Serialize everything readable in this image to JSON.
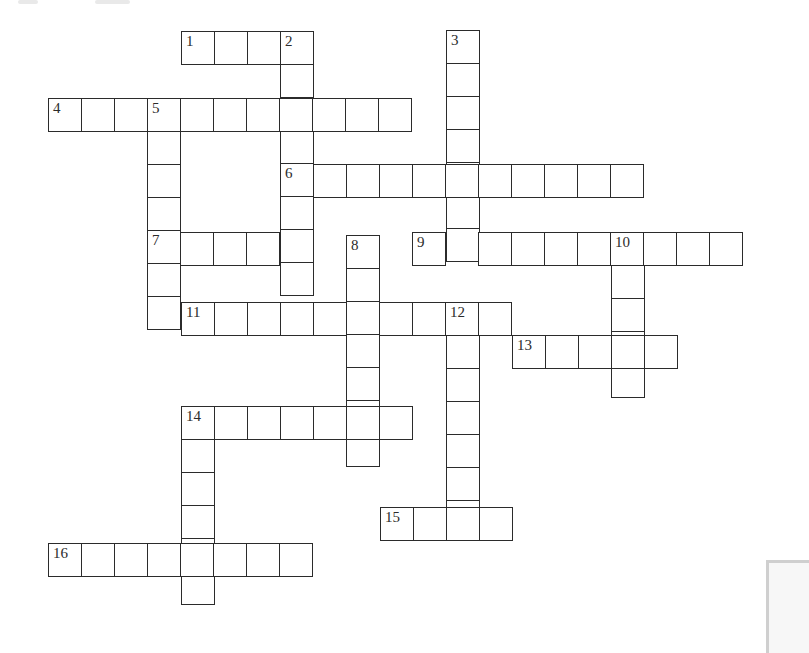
{
  "puzzle": {
    "type": "crossword",
    "cell_size": 33,
    "border_color": "#2b2b2b",
    "background": "#ffffff"
  },
  "words": [
    {
      "number": "1",
      "direction": "across",
      "x": 181,
      "y": 31,
      "length": 4,
      "label": "1"
    },
    {
      "number": "2",
      "direction": "down",
      "x": 280,
      "y": 31,
      "length": 8,
      "label": "2"
    },
    {
      "number": "3",
      "direction": "down",
      "x": 446,
      "y": 30,
      "length": 7,
      "label": "3"
    },
    {
      "number": "4",
      "direction": "across",
      "x": 48,
      "y": 98,
      "length": 11,
      "label": "4"
    },
    {
      "number": "5",
      "direction": "down",
      "x": 147,
      "y": 98,
      "length": 7,
      "label": "5"
    },
    {
      "number": "6",
      "direction": "across",
      "x": 280,
      "y": 164,
      "length": 11,
      "label": "6"
    },
    {
      "number": "7",
      "direction": "across",
      "x": 147,
      "y": 232,
      "length": 5,
      "label": "7"
    },
    {
      "number": "8",
      "direction": "down",
      "x": 346,
      "y": 235,
      "length": 7,
      "label": "8"
    },
    {
      "number": "9",
      "direction": "across",
      "x": 412,
      "y": 232,
      "length": 10,
      "label": "9"
    },
    {
      "number": "10",
      "direction": "down",
      "x": 611,
      "y": 232,
      "length": 5,
      "label": "10"
    },
    {
      "number": "11",
      "direction": "across",
      "x": 181,
      "y": 302,
      "length": 10,
      "label": "11"
    },
    {
      "number": "12",
      "direction": "down",
      "x": 446,
      "y": 302,
      "length": 7,
      "label": "12"
    },
    {
      "number": "13",
      "direction": "across",
      "x": 512,
      "y": 335,
      "length": 5,
      "label": "13"
    },
    {
      "number": "14",
      "direction": "across",
      "x": 181,
      "y": 406,
      "length": 7,
      "label": "14"
    },
    {
      "number": "14",
      "direction": "down",
      "x": 181,
      "y": 406,
      "length": 6,
      "label": ""
    },
    {
      "number": "15",
      "direction": "across",
      "x": 380,
      "y": 507,
      "length": 4,
      "label": "15"
    },
    {
      "number": "16",
      "direction": "across",
      "x": 48,
      "y": 543,
      "length": 8,
      "label": "16"
    }
  ]
}
